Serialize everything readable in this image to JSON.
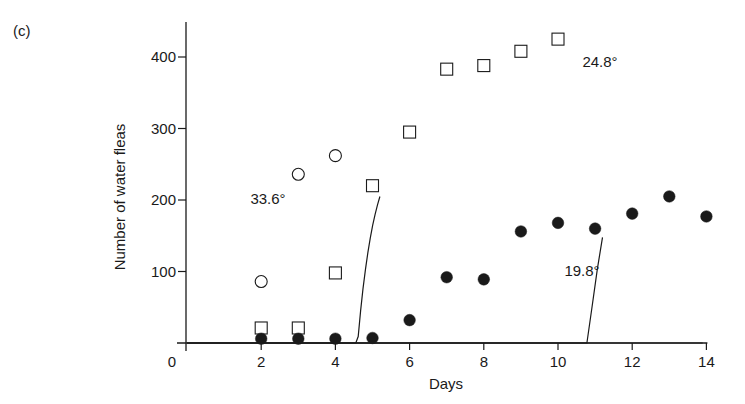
{
  "panel_label": "(c)",
  "colors": {
    "ink": "#1a1a1a",
    "background": "#ffffff"
  },
  "chart_data": {
    "type": "scatter",
    "title": "",
    "xlabel": "Days",
    "ylabel": "Number of water fleas",
    "xlim": [
      0,
      14
    ],
    "ylim": [
      0,
      440
    ],
    "x_ticks": [
      0,
      2,
      4,
      6,
      8,
      10,
      12,
      14
    ],
    "y_ticks": [
      100,
      200,
      300,
      400
    ],
    "x_tick_labels": [
      "0",
      "2",
      "4",
      "6",
      "8",
      "10",
      "12",
      "14"
    ],
    "y_tick_labels": [
      "100",
      "200",
      "300",
      "400"
    ],
    "grid": false,
    "legend": "none (curves labeled inline)",
    "series": [
      {
        "name": "33.6°",
        "marker": "open-circle",
        "points": [
          {
            "x": 2,
            "y": 86
          },
          {
            "x": 3,
            "y": 236
          },
          {
            "x": 4,
            "y": 262
          }
        ],
        "fit_curve": {
          "type": "logistic",
          "x_range": [
            0,
            5.2
          ],
          "K": 280,
          "r": 2.2,
          "x_mid": 2.3
        },
        "label_position": {
          "x": 1.6,
          "y": 200
        }
      },
      {
        "name": "24.8°",
        "marker": "open-square",
        "points": [
          {
            "x": 2,
            "y": 21
          },
          {
            "x": 3,
            "y": 21
          },
          {
            "x": 4,
            "y": 98
          },
          {
            "x": 5,
            "y": 220
          },
          {
            "x": 6,
            "y": 295
          },
          {
            "x": 7,
            "y": 383
          },
          {
            "x": 8,
            "y": 388
          },
          {
            "x": 9,
            "y": 408
          },
          {
            "x": 10,
            "y": 425
          }
        ],
        "fit_curve": {
          "type": "logistic",
          "x_range": [
            0,
            11.2
          ],
          "K": 432,
          "r": 1.05,
          "x_mid": 5.4
        },
        "label_position": {
          "x": 10.5,
          "y": 400
        }
      },
      {
        "name": "19.8°",
        "marker": "filled-circle",
        "points": [
          {
            "x": 2,
            "y": 6
          },
          {
            "x": 3,
            "y": 6
          },
          {
            "x": 4,
            "y": 6
          },
          {
            "x": 5,
            "y": 7
          },
          {
            "x": 6,
            "y": 32
          },
          {
            "x": 7,
            "y": 92
          },
          {
            "x": 8,
            "y": 89
          },
          {
            "x": 9,
            "y": 156
          },
          {
            "x": 10,
            "y": 168
          },
          {
            "x": 11,
            "y": 160
          },
          {
            "x": 12,
            "y": 181
          },
          {
            "x": 13,
            "y": 205
          },
          {
            "x": 14,
            "y": 177
          }
        ],
        "fit_curve": {
          "type": "logistic",
          "x_range": [
            0,
            13.9
          ],
          "K": 225,
          "r": 0.42,
          "x_mid": 9.6
        },
        "label_position": {
          "x": 10.0,
          "y": 95
        }
      }
    ]
  }
}
